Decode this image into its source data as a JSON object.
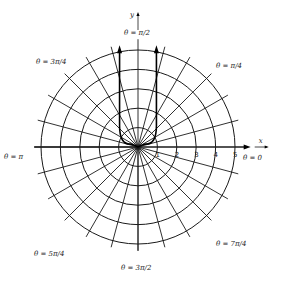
{
  "figure": {
    "type": "polar-coordinate-grid",
    "center": [
      138,
      147
    ],
    "unit_px": 19.4,
    "circle_radii": [
      1,
      2,
      3,
      4,
      5
    ],
    "ray_step_degrees": 15,
    "axes": {
      "x_label": "x",
      "y_label": "y"
    },
    "x_ticks": [
      "1",
      "2",
      "3",
      "4",
      "5"
    ],
    "angle_labels": {
      "t0": "θ = 0",
      "t45": "θ = π/4",
      "t90": "θ = π/2",
      "t135": "θ = 3π/4",
      "t180": "θ = π",
      "t225": "θ = 5π/4",
      "t270": "θ = 3π/2",
      "t315": "θ = 7π/4"
    },
    "curve": "U-shaped bold curve from origin opening upward, two vertical arrows along x≈±1"
  }
}
